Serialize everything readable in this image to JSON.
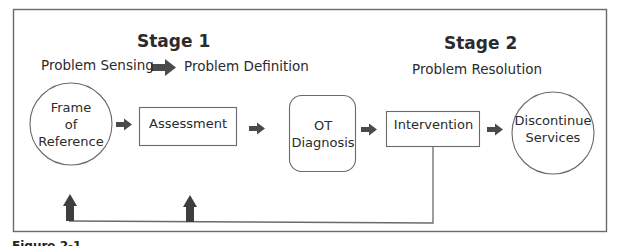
{
  "diagram": {
    "type": "flowchart",
    "stages": [
      {
        "title": "Stage 1",
        "phases": [
          "Problem Sensing",
          "Problem Definition"
        ]
      },
      {
        "title": "Stage 2",
        "phases": [
          "Problem Resolution"
        ]
      }
    ],
    "nodes": [
      {
        "id": "frame",
        "shape": "circle",
        "lines": [
          "Frame",
          "of",
          "Reference"
        ]
      },
      {
        "id": "assessment",
        "shape": "rectangle",
        "lines": [
          "Assessment"
        ]
      },
      {
        "id": "diagnosis",
        "shape": "rounded-rectangle",
        "lines": [
          "OT",
          "Diagnosis"
        ]
      },
      {
        "id": "intervention",
        "shape": "rectangle",
        "lines": [
          "Intervention"
        ]
      },
      {
        "id": "discontinue",
        "shape": "circle",
        "lines": [
          "Discontinue",
          "Services"
        ]
      }
    ],
    "edges": [
      {
        "from": "frame",
        "to": "assessment"
      },
      {
        "from": "assessment",
        "to": "diagnosis"
      },
      {
        "from": "diagnosis",
        "to": "intervention"
      },
      {
        "from": "intervention",
        "to": "discontinue"
      },
      {
        "from": "intervention",
        "to": "frame",
        "type": "feedback"
      },
      {
        "from": "intervention",
        "to": "assessment",
        "type": "feedback"
      }
    ],
    "colors": {
      "line": "#5a5a5a",
      "arrow": "#4a4a4a",
      "text": "#2b2b2b"
    }
  },
  "stage1": {
    "title": "Stage 1",
    "phase_from": "Problem Sensing",
    "phase_to": "Problem Definition"
  },
  "stage2": {
    "title": "Stage 2",
    "phase": "Problem Resolution"
  },
  "nodes": {
    "frame": {
      "l1": "Frame",
      "l2": "of",
      "l3": "Reference"
    },
    "assessment": {
      "l1": "Assessment"
    },
    "diagnosis": {
      "l1": "OT",
      "l2": "Diagnosis"
    },
    "intervention": {
      "l1": "Intervention"
    },
    "discontinue": {
      "l1": "Discontinue",
      "l2": "Services"
    }
  },
  "caption": {
    "text": "Figure 2-1"
  }
}
